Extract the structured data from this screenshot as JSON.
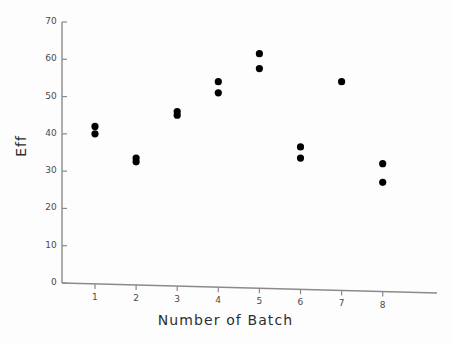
{
  "chart_data": {
    "type": "scatter",
    "title": "",
    "xlabel": "Number of Batch",
    "ylabel": "Eff",
    "xlim": [
      0.3,
      8.9
    ],
    "ylim": [
      0,
      70
    ],
    "grid": false,
    "legend": null,
    "xticks": [
      1,
      2,
      3,
      4,
      5,
      6,
      7,
      8
    ],
    "xtick_labels": [
      "1",
      "2",
      "3",
      "4",
      "5",
      "6",
      "7",
      "8"
    ],
    "yticks": [
      0,
      10,
      20,
      30,
      40,
      50,
      60,
      70
    ],
    "ytick_labels": [
      "0",
      "10",
      "20",
      "30",
      "40",
      "50",
      "60",
      "70"
    ],
    "marker": "filled-circle",
    "marker_color": "#000000",
    "points": [
      {
        "x": 1,
        "y": 42.0
      },
      {
        "x": 1,
        "y": 40.0
      },
      {
        "x": 2,
        "y": 33.5
      },
      {
        "x": 2,
        "y": 32.5
      },
      {
        "x": 3,
        "y": 46.0
      },
      {
        "x": 3,
        "y": 45.0
      },
      {
        "x": 4,
        "y": 54.0
      },
      {
        "x": 4,
        "y": 51.0
      },
      {
        "x": 5,
        "y": 61.5
      },
      {
        "x": 5,
        "y": 57.5
      },
      {
        "x": 6,
        "y": 36.5
      },
      {
        "x": 6,
        "y": 33.5
      },
      {
        "x": 7,
        "y": 54.0
      },
      {
        "x": 8,
        "y": 32.0
      },
      {
        "x": 8,
        "y": 27.0
      }
    ]
  },
  "axes": {
    "line_color": "#8a8a8a",
    "tick_color": "#8a8a8a"
  }
}
